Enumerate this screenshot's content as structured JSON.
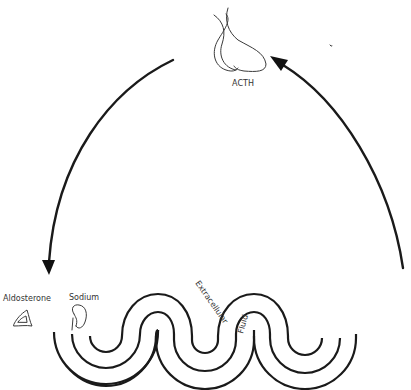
{
  "diagram": {
    "title": "",
    "nodes": [
      {
        "id": "pituitary",
        "label": "ACTH",
        "icon": "pituitary-gland-icon"
      },
      {
        "id": "adrenal",
        "label": "Aldosterone",
        "icon": "adrenal-gland-icon"
      },
      {
        "id": "kidney",
        "label": "Sodium",
        "icon": "kidney-icon"
      },
      {
        "id": "ecf",
        "label_part1": "Extracellular",
        "label_part2": "Fluid",
        "icon": "extracellular-fluid-waves"
      }
    ],
    "edges": [
      {
        "from": "pituitary",
        "to": "adrenal",
        "style": "curved-arrow",
        "direction": "down-left"
      },
      {
        "from": "ecf",
        "to": "pituitary",
        "style": "curved-arrow",
        "direction": "up-left"
      }
    ],
    "colors": {
      "background": "#ffffff",
      "stroke": "#1a1a1a",
      "text": "#333333"
    }
  }
}
